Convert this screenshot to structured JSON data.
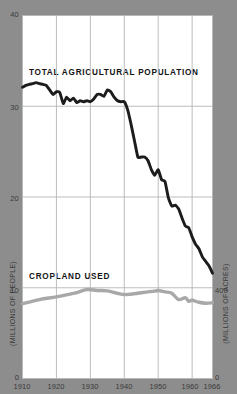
{
  "chart_data": {
    "type": "line",
    "title": "",
    "xlabel": "",
    "ylabel": "(MILLIONS OF PEOPLE)",
    "ylabel_right": "(MILLIONS OF ACRES)",
    "xlim": [
      1910,
      1966
    ],
    "ylim": [
      0,
      40
    ],
    "ylim_right": [
      0,
      1600
    ],
    "grid": true,
    "legend_position": "inline-annotation",
    "xticks": [
      "1910",
      "1920",
      "1930",
      "1940",
      "1950",
      "1960",
      "1966"
    ],
    "xtick_values": [
      1910,
      1920,
      1930,
      1940,
      1950,
      1960,
      1966
    ],
    "yticks_left": [
      "0",
      "10",
      "20",
      "30",
      "40"
    ],
    "ytick_values_left": [
      0,
      10,
      20,
      30,
      40
    ],
    "yticks_right": [
      "0",
      "400"
    ],
    "ytick_values_right": [
      0,
      400
    ],
    "series": [
      {
        "name": "TOTAL AGRICULTURAL POPULATION",
        "color": "#1c1c1c",
        "axis": "left",
        "units": "millions of people",
        "x": [
          1910,
          1911,
          1912,
          1913,
          1914,
          1915,
          1916,
          1917,
          1918,
          1919,
          1920,
          1921,
          1922,
          1923,
          1924,
          1925,
          1926,
          1927,
          1928,
          1929,
          1930,
          1931,
          1932,
          1933,
          1934,
          1935,
          1936,
          1937,
          1938,
          1939,
          1940,
          1941,
          1942,
          1943,
          1944,
          1945,
          1946,
          1947,
          1948,
          1949,
          1950,
          1951,
          1952,
          1953,
          1954,
          1955,
          1956,
          1957,
          1958,
          1959,
          1960,
          1961,
          1962,
          1963,
          1964,
          1965,
          1966
        ],
        "values": [
          32.1,
          32.3,
          32.4,
          32.5,
          32.6,
          32.5,
          32.4,
          32.3,
          31.8,
          31.3,
          31.6,
          31.5,
          30.3,
          31.0,
          30.6,
          30.9,
          30.4,
          30.6,
          30.5,
          30.6,
          30.5,
          30.8,
          31.3,
          31.3,
          31.1,
          31.8,
          31.6,
          31.0,
          30.6,
          30.5,
          30.5,
          29.6,
          28.0,
          26.2,
          24.4,
          24.4,
          24.4,
          24.0,
          23.0,
          22.4,
          23.0,
          21.9,
          21.7,
          19.9,
          19.0,
          19.1,
          18.7,
          17.7,
          16.8,
          16.6,
          15.6,
          14.8,
          14.3,
          13.4,
          12.9,
          12.4,
          11.6
        ]
      },
      {
        "name": "CROPLAND USED",
        "color": "#a8a8a8",
        "axis": "right",
        "units": "millions of acres",
        "left_axis_equivalent": [
          8.3,
          9.8,
          9.2,
          9.7,
          8.3
        ],
        "x": [
          1910,
          1915,
          1920,
          1925,
          1929,
          1932,
          1935,
          1940,
          1945,
          1949,
          1950,
          1952,
          1954,
          1956,
          1958,
          1959,
          1960,
          1962,
          1964,
          1966
        ],
        "values": [
          330,
          348,
          360,
          375,
          392,
          388,
          386,
          370,
          378,
          385,
          388,
          382,
          376,
          348,
          356,
          340,
          345,
          336,
          332,
          334
        ]
      }
    ],
    "annotations": [
      {
        "text": "TOTAL AGRICULTURAL POPULATION",
        "x": 1912,
        "y": 34.5
      },
      {
        "text": "CROPLAND USED",
        "x": 1912,
        "y": 10.4
      }
    ]
  },
  "colors": {
    "background": "#8d8d8d",
    "plot_background": "#ffffff",
    "grid": "#b5b5b5",
    "population_line": "#1c1c1c",
    "cropland_line": "#a8a8a8",
    "tick_text": "#3a3a3a"
  }
}
